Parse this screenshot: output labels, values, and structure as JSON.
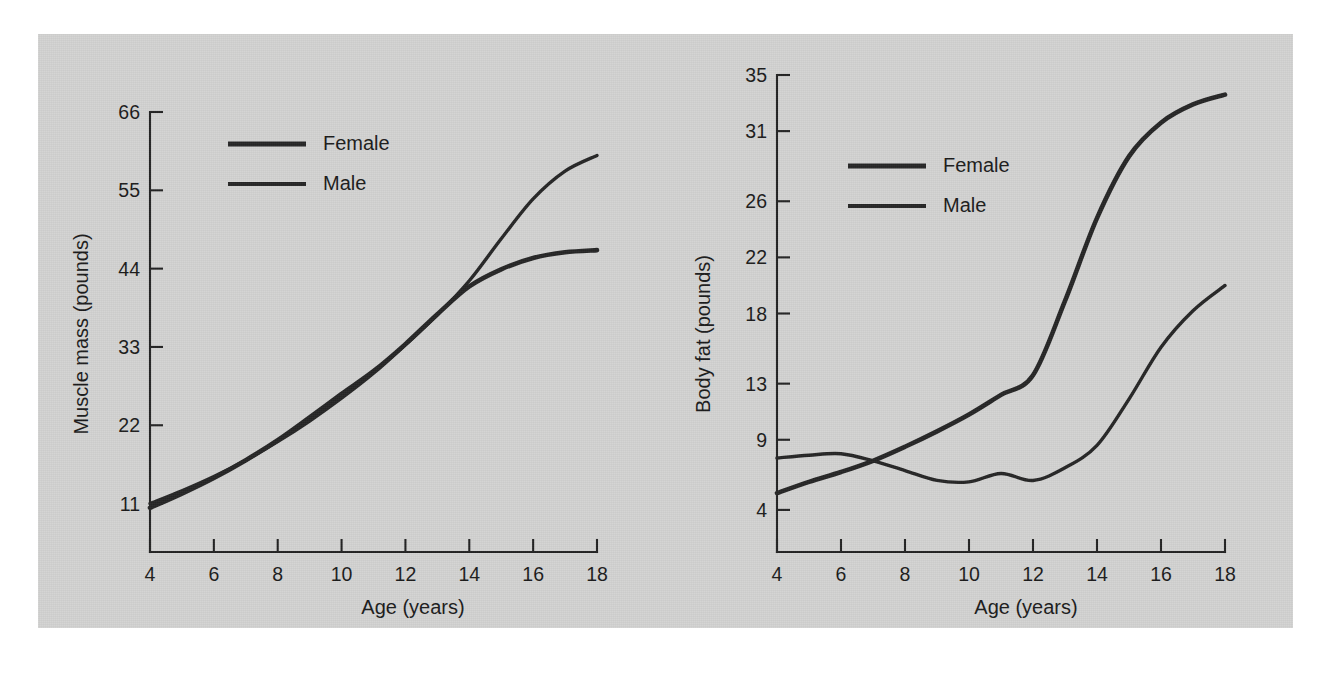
{
  "figure": {
    "background_color": "#d3d3d2",
    "page_color": "#ffffff",
    "ink_color": "#262626"
  },
  "chart_data": [
    {
      "id": "muscle-mass",
      "type": "line",
      "title": "",
      "xlabel": "Age (years)",
      "ylabel": "Muscle mass (pounds)",
      "xlim": [
        4,
        18
      ],
      "ylim": [
        4.2,
        66
      ],
      "xticks": [
        4,
        6,
        8,
        10,
        12,
        14,
        16,
        18
      ],
      "xtick_labels": [
        "4",
        "6",
        "8",
        "10",
        "12",
        "14",
        "16",
        "18"
      ],
      "yticks": [
        11,
        22,
        33,
        44,
        55,
        66
      ],
      "ytick_labels": [
        "11",
        "22",
        "33",
        "44",
        "55",
        "66"
      ],
      "grid": false,
      "legend_position": "upper-center-left",
      "legend_entries": [
        "Female",
        "Male"
      ],
      "x": [
        4,
        5,
        6,
        7,
        8,
        9,
        10,
        11,
        12,
        13,
        14,
        15,
        16,
        17,
        18
      ],
      "series": [
        {
          "name": "Female",
          "values": [
            10.4,
            12.4,
            14.6,
            17.1,
            19.9,
            23.1,
            26.4,
            29.6,
            33.4,
            37.6,
            41.5,
            43.9,
            45.5,
            46.3,
            46.6
          ]
        },
        {
          "name": "Male",
          "values": [
            11.0,
            12.8,
            14.8,
            17.1,
            19.7,
            22.6,
            25.8,
            29.3,
            33.3,
            37.5,
            42.3,
            48.2,
            53.8,
            57.7,
            59.9
          ]
        }
      ],
      "annotations": [
        {
          "text": "curves cross near age 13.5 at about 41 pounds"
        }
      ]
    },
    {
      "id": "body-fat",
      "type": "line",
      "title": "",
      "xlabel": "Age (years)",
      "ylabel": "Body fat (pounds)",
      "xlim": [
        4,
        18
      ],
      "ylim": [
        1.0,
        35
      ],
      "xticks": [
        4,
        6,
        8,
        10,
        12,
        14,
        16,
        18
      ],
      "xtick_labels": [
        "4",
        "6",
        "8",
        "10",
        "12",
        "14",
        "16",
        "18"
      ],
      "yticks": [
        4,
        9,
        13,
        18,
        22,
        26,
        31,
        35
      ],
      "ytick_labels": [
        "4",
        "9",
        "13",
        "18",
        "22",
        "26",
        "31",
        "35"
      ],
      "grid": false,
      "legend_position": "upper-center-left",
      "legend_entries": [
        "Female",
        "Male"
      ],
      "x": [
        4,
        5,
        6,
        7,
        8,
        9,
        10,
        11,
        12,
        13,
        14,
        15,
        16,
        17,
        18
      ],
      "series": [
        {
          "name": "Female",
          "values": [
            5.2,
            6.0,
            6.7,
            7.5,
            8.5,
            9.6,
            10.8,
            12.2,
            13.6,
            18.9,
            24.8,
            29.2,
            31.6,
            32.9,
            33.6
          ]
        },
        {
          "name": "Male",
          "values": [
            7.7,
            7.9,
            8.0,
            7.5,
            6.8,
            6.1,
            6.0,
            6.6,
            6.1,
            7.0,
            8.6,
            11.9,
            15.6,
            18.2,
            20.0
          ]
        }
      ],
      "annotations": [
        {
          "text": "curves cross near age 6.8 at about 7.3 pounds"
        },
        {
          "text": "male curve shows a small bump near age 11"
        }
      ]
    }
  ]
}
